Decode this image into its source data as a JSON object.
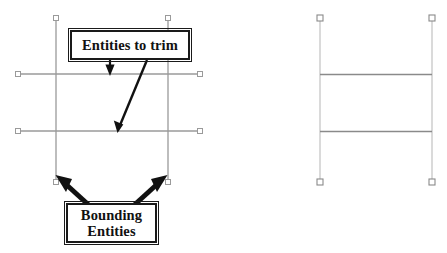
{
  "diagram": {
    "background_color": "#ffffff",
    "line_color": "#9a9a9a",
    "line_color_dark": "#8a8a8a",
    "annotation_color": "#1a1a1a",
    "grip_fill": "#ffffff",
    "grip_stroke": "#8a8a8a"
  },
  "callouts": {
    "trim": {
      "label": "Entities to trim",
      "x": 70,
      "y": 30,
      "width": 120,
      "height": 30
    },
    "bounding": {
      "label_line1": "Bounding",
      "label_line2": "Entities",
      "x": 66,
      "y": 203,
      "width": 91,
      "height": 40
    }
  },
  "panels": [
    {
      "name": "before",
      "description": "Entities before trimming: two long horizontal lines crossing two vertical bounding lines",
      "vertical_lines": [
        {
          "x": 56,
          "y1": 18,
          "y2": 182
        },
        {
          "x": 168,
          "y1": 18,
          "y2": 182
        }
      ],
      "horizontal_lines": [
        {
          "y": 74,
          "x1": 18,
          "x2": 200
        },
        {
          "y": 131,
          "x1": 18,
          "x2": 200
        }
      ],
      "grips": [
        {
          "x": 56,
          "y": 18
        },
        {
          "x": 168,
          "y": 18
        },
        {
          "x": 56,
          "y": 182
        },
        {
          "x": 168,
          "y": 182
        },
        {
          "x": 18,
          "y": 74
        },
        {
          "x": 200,
          "y": 74
        },
        {
          "x": 18,
          "y": 131
        },
        {
          "x": 200,
          "y": 131
        }
      ]
    },
    {
      "name": "after",
      "description": "Result after trimming: horizontal lines clipped to the bounding vertical lines",
      "vertical_lines": [
        {
          "x": 320,
          "y1": 18,
          "y2": 182
        },
        {
          "x": 432,
          "y1": 18,
          "y2": 182
        }
      ],
      "horizontal_lines": [
        {
          "y": 74,
          "x1": 320,
          "x2": 432
        },
        {
          "y": 131,
          "x1": 320,
          "x2": 432
        }
      ],
      "grips": [
        {
          "x": 320,
          "y": 18
        },
        {
          "x": 432,
          "y": 18
        },
        {
          "x": 320,
          "y": 182
        },
        {
          "x": 432,
          "y": 182
        }
      ]
    }
  ],
  "arrows": [
    {
      "name": "arrow-to-upper-trim-line",
      "from_x": 110,
      "from_y": 60,
      "to_x": 110,
      "to_y": 74,
      "style": "thin-straight-down"
    },
    {
      "name": "arrow-to-lower-trim-line",
      "from_x": 147,
      "from_y": 60,
      "to_x": 118,
      "to_y": 131,
      "style": "thin-diagonal"
    },
    {
      "name": "arrow-to-left-bounding-line",
      "from_x": 92,
      "from_y": 208,
      "to_x": 57,
      "to_y": 176,
      "style": "thick-diagonal"
    },
    {
      "name": "arrow-to-right-bounding-line",
      "from_x": 131,
      "from_y": 208,
      "to_x": 166,
      "to_y": 176,
      "style": "thick-diagonal"
    }
  ]
}
